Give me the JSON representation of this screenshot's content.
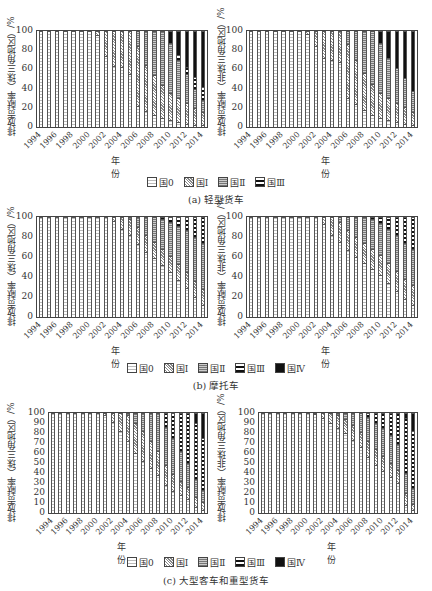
{
  "chart_data": [
    {
      "type": "bar",
      "stacked": true,
      "panel": "a",
      "region": "珠三角地区",
      "title": "",
      "xlabel": "年份",
      "ylabel": "排放贡献率（珠三角地区）/%",
      "ylim": [
        0,
        100
      ],
      "yticks": [
        0,
        20,
        40,
        60,
        80,
        100
      ],
      "categories": [
        "1994",
        "1995",
        "1996",
        "1997",
        "1998",
        "1999",
        "2000",
        "2001",
        "2002",
        "2003",
        "2004",
        "2005",
        "2006",
        "2007",
        "2008",
        "2009",
        "2010",
        "2011",
        "2012",
        "2013",
        "2014"
      ],
      "series": [
        {
          "name": "国0",
          "values": [
            100,
            100,
            100,
            100,
            100,
            100,
            100,
            96,
            74,
            64,
            62,
            55,
            22,
            17,
            12,
            9,
            7,
            5,
            3,
            2,
            2
          ]
        },
        {
          "name": "国I",
          "values": [
            0,
            0,
            0,
            0,
            0,
            0,
            0,
            4,
            26,
            36,
            38,
            45,
            62,
            48,
            42,
            35,
            28,
            25,
            22,
            18,
            14
          ]
        },
        {
          "name": "国II",
          "values": [
            0,
            0,
            0,
            0,
            0,
            0,
            0,
            0,
            0,
            0,
            0,
            0,
            16,
            35,
            46,
            56,
            53,
            40,
            30,
            20,
            12
          ]
        },
        {
          "name": "国III",
          "values": [
            0,
            0,
            0,
            0,
            0,
            0,
            0,
            0,
            0,
            0,
            0,
            0,
            0,
            0,
            0,
            0,
            0,
            5,
            8,
            12,
            14
          ]
        },
        {
          "name": "国IV",
          "values": [
            0,
            0,
            0,
            0,
            0,
            0,
            0,
            0,
            0,
            0,
            0,
            0,
            0,
            0,
            0,
            0,
            12,
            25,
            37,
            48,
            58
          ]
        }
      ]
    },
    {
      "type": "bar",
      "stacked": true,
      "panel": "a",
      "region": "非珠三角地区",
      "xlabel": "年份",
      "ylabel": "排放贡献率（非珠三角地区）/%",
      "ylim": [
        0,
        100
      ],
      "yticks": [
        0,
        20,
        40,
        60,
        80,
        100
      ],
      "categories": [
        "1994",
        "1995",
        "1996",
        "1997",
        "1998",
        "1999",
        "2000",
        "2001",
        "2002",
        "2003",
        "2004",
        "2005",
        "2006",
        "2007",
        "2008",
        "2009",
        "2010",
        "2011",
        "2012",
        "2013",
        "2014"
      ],
      "series": [
        {
          "name": "国0",
          "values": [
            100,
            100,
            100,
            100,
            100,
            100,
            100,
            97,
            84,
            72,
            70,
            68,
            30,
            24,
            18,
            12,
            9,
            7,
            5,
            3,
            2
          ]
        },
        {
          "name": "国I",
          "values": [
            0,
            0,
            0,
            0,
            0,
            0,
            0,
            3,
            16,
            28,
            30,
            32,
            56,
            46,
            38,
            33,
            26,
            23,
            20,
            18,
            14
          ]
        },
        {
          "name": "国II",
          "values": [
            0,
            0,
            0,
            0,
            0,
            0,
            0,
            0,
            0,
            0,
            0,
            0,
            14,
            30,
            44,
            55,
            53,
            42,
            36,
            30,
            22
          ]
        },
        {
          "name": "国III",
          "values": [
            0,
            0,
            0,
            0,
            0,
            0,
            0,
            0,
            0,
            0,
            0,
            0,
            0,
            0,
            0,
            0,
            0,
            0,
            0,
            0,
            0
          ]
        },
        {
          "name": "国IV",
          "values": [
            0,
            0,
            0,
            0,
            0,
            0,
            0,
            0,
            0,
            0,
            0,
            0,
            0,
            0,
            0,
            0,
            12,
            28,
            39,
            49,
            62
          ]
        }
      ]
    },
    {
      "type": "bar",
      "stacked": true,
      "panel": "b",
      "region": "珠三角地区",
      "xlabel": "年份",
      "ylabel": "排放贡献率（珠三角地区）/%",
      "ylim": [
        0,
        100
      ],
      "yticks": [
        0,
        20,
        40,
        60,
        80,
        100
      ],
      "categories": [
        "1994",
        "1995",
        "1996",
        "1997",
        "1998",
        "1999",
        "2000",
        "2001",
        "2002",
        "2003",
        "2004",
        "2005",
        "2006",
        "2007",
        "2008",
        "2009",
        "2010",
        "2011",
        "2012",
        "2013",
        "2014"
      ],
      "series": [
        {
          "name": "国0",
          "values": [
            100,
            100,
            100,
            100,
            100,
            100,
            100,
            100,
            100,
            96,
            88,
            82,
            73,
            65,
            59,
            52,
            45,
            37,
            29,
            20,
            12
          ]
        },
        {
          "name": "国I",
          "values": [
            0,
            0,
            0,
            0,
            0,
            0,
            0,
            0,
            0,
            4,
            12,
            16,
            17,
            17,
            16,
            16,
            16,
            16,
            16,
            16,
            16
          ]
        },
        {
          "name": "国II",
          "values": [
            0,
            0,
            0,
            0,
            0,
            0,
            0,
            0,
            0,
            0,
            0,
            2,
            10,
            18,
            25,
            30,
            34,
            38,
            42,
            44,
            46
          ]
        },
        {
          "name": "国III",
          "values": [
            0,
            0,
            0,
            0,
            0,
            0,
            0,
            0,
            0,
            0,
            0,
            0,
            0,
            0,
            0,
            2,
            5,
            9,
            13,
            20,
            26
          ]
        },
        {
          "name": "国IV",
          "values": [
            0,
            0,
            0,
            0,
            0,
            0,
            0,
            0,
            0,
            0,
            0,
            0,
            0,
            0,
            0,
            0,
            0,
            0,
            0,
            0,
            0
          ]
        }
      ]
    },
    {
      "type": "bar",
      "stacked": true,
      "panel": "b",
      "region": "非珠三角地区",
      "xlabel": "年份",
      "ylabel": "排放贡献率（非珠三角地区）/%",
      "ylim": [
        0,
        100
      ],
      "yticks": [
        0,
        20,
        40,
        60,
        80,
        100
      ],
      "categories": [
        "1994",
        "1995",
        "1996",
        "1997",
        "1998",
        "1999",
        "2000",
        "2001",
        "2002",
        "2003",
        "2004",
        "2005",
        "2006",
        "2007",
        "2008",
        "2009",
        "2010",
        "2011",
        "2012",
        "2013",
        "2014"
      ],
      "series": [
        {
          "name": "国0",
          "values": [
            100,
            100,
            100,
            100,
            100,
            100,
            100,
            100,
            100,
            93,
            82,
            75,
            67,
            60,
            54,
            48,
            42,
            34,
            26,
            18,
            12
          ]
        },
        {
          "name": "国I",
          "values": [
            0,
            0,
            0,
            0,
            0,
            0,
            0,
            0,
            0,
            7,
            18,
            20,
            20,
            20,
            20,
            20,
            20,
            20,
            20,
            20,
            20
          ]
        },
        {
          "name": "国II",
          "values": [
            0,
            0,
            0,
            0,
            0,
            0,
            0,
            0,
            0,
            0,
            0,
            5,
            13,
            20,
            26,
            30,
            32,
            34,
            36,
            36,
            36
          ]
        },
        {
          "name": "国III",
          "values": [
            0,
            0,
            0,
            0,
            0,
            0,
            0,
            0,
            0,
            0,
            0,
            0,
            0,
            0,
            0,
            2,
            6,
            12,
            18,
            26,
            32
          ]
        },
        {
          "name": "国IV",
          "values": [
            0,
            0,
            0,
            0,
            0,
            0,
            0,
            0,
            0,
            0,
            0,
            0,
            0,
            0,
            0,
            0,
            0,
            0,
            0,
            0,
            0
          ]
        }
      ]
    },
    {
      "type": "bar",
      "stacked": true,
      "panel": "c",
      "region": "珠三角地区",
      "xlabel": "年份",
      "ylabel": "排放贡献率（珠三角地区）/%",
      "ylim": [
        0,
        100
      ],
      "yticks": [
        0,
        10,
        20,
        30,
        40,
        50,
        60,
        70,
        80,
        90,
        100
      ],
      "categories": [
        "1994",
        "1995",
        "1996",
        "1997",
        "1998",
        "1999",
        "2000",
        "2001",
        "2002",
        "2003",
        "2004",
        "2005",
        "2006",
        "2007",
        "2008",
        "2009",
        "2010",
        "2011",
        "2012",
        "2013",
        "2014"
      ],
      "series": [
        {
          "name": "国0",
          "values": [
            100,
            100,
            100,
            100,
            100,
            100,
            100,
            98,
            91,
            82,
            72,
            60,
            52,
            45,
            38,
            28,
            22,
            18,
            14,
            6,
            3
          ]
        },
        {
          "name": "国I",
          "values": [
            0,
            0,
            0,
            0,
            0,
            0,
            0,
            2,
            9,
            18,
            26,
            30,
            30,
            27,
            24,
            20,
            17,
            14,
            12,
            10,
            8
          ]
        },
        {
          "name": "国II",
          "values": [
            0,
            0,
            0,
            0,
            0,
            0,
            0,
            0,
            0,
            0,
            2,
            10,
            18,
            28,
            38,
            38,
            36,
            30,
            24,
            18,
            12
          ]
        },
        {
          "name": "国III",
          "values": [
            0,
            0,
            0,
            0,
            0,
            0,
            0,
            0,
            0,
            0,
            0,
            0,
            0,
            0,
            0,
            14,
            25,
            38,
            50,
            56,
            52
          ]
        },
        {
          "name": "国IV",
          "values": [
            0,
            0,
            0,
            0,
            0,
            0,
            0,
            0,
            0,
            0,
            0,
            0,
            0,
            0,
            0,
            0,
            0,
            0,
            0,
            10,
            25
          ]
        }
      ]
    },
    {
      "type": "bar",
      "stacked": true,
      "panel": "c",
      "region": "非珠三角地区",
      "xlabel": "年份",
      "ylabel": "排放贡献率（非珠三角地区）/%",
      "ylim": [
        0,
        100
      ],
      "yticks": [
        0,
        10,
        20,
        30,
        40,
        50,
        60,
        70,
        80,
        90,
        100
      ],
      "categories": [
        "1994",
        "1995",
        "1996",
        "1997",
        "1998",
        "1999",
        "2000",
        "2001",
        "2002",
        "2003",
        "2004",
        "2005",
        "2006",
        "2007",
        "2008",
        "2009",
        "2010",
        "2011",
        "2012",
        "2013",
        "2014"
      ],
      "series": [
        {
          "name": "国0",
          "values": [
            100,
            100,
            100,
            100,
            100,
            100,
            100,
            99,
            95,
            90,
            85,
            80,
            73,
            66,
            56,
            48,
            42,
            36,
            30,
            8,
            3
          ]
        },
        {
          "name": "国I",
          "values": [
            0,
            0,
            0,
            0,
            0,
            0,
            0,
            1,
            5,
            10,
            13,
            14,
            15,
            15,
            16,
            16,
            15,
            14,
            13,
            12,
            6
          ]
        },
        {
          "name": "国II",
          "values": [
            0,
            0,
            0,
            0,
            0,
            0,
            0,
            0,
            0,
            0,
            2,
            6,
            12,
            19,
            24,
            26,
            28,
            28,
            26,
            20,
            16
          ]
        },
        {
          "name": "国III",
          "values": [
            0,
            0,
            0,
            0,
            0,
            0,
            0,
            0,
            0,
            0,
            0,
            0,
            0,
            0,
            4,
            10,
            15,
            22,
            31,
            55,
            57
          ]
        },
        {
          "name": "国IV",
          "values": [
            0,
            0,
            0,
            0,
            0,
            0,
            0,
            0,
            0,
            0,
            0,
            0,
            0,
            0,
            0,
            0,
            0,
            0,
            0,
            5,
            18
          ]
        }
      ]
    }
  ],
  "figure": {
    "panels": [
      {
        "id": "a",
        "caption": "(a) 轻型货车",
        "legend": [
          "国0",
          "国Ⅰ",
          "国Ⅱ",
          "国Ⅲ"
        ],
        "left_ylabel": "排放贡献率（珠三角地区）/%",
        "right_ylabel": "排放贡献率（非珠三角地区）/%"
      },
      {
        "id": "b",
        "caption": "(b) 摩托车",
        "legend": [
          "国0",
          "国Ⅰ",
          "国Ⅱ",
          "国Ⅲ",
          "国Ⅳ"
        ],
        "left_ylabel": "排放贡献率（珠三角地区）/%",
        "right_ylabel": "排放贡献率（非珠三角地区）/%"
      },
      {
        "id": "c",
        "caption": "(c) 大型客车和重型货车",
        "legend": [
          "国0",
          "国Ⅰ",
          "国Ⅱ",
          "国Ⅲ",
          "国Ⅳ"
        ],
        "left_ylabel": "排放贡献率（珠三角地区）/%",
        "right_ylabel": "排放贡献率（非珠三角地区）/%"
      }
    ],
    "xlabel": "年份",
    "xticks": [
      "1994",
      "1996",
      "1998",
      "2000",
      "2002",
      "2004",
      "2006",
      "2008",
      "2010",
      "2012",
      "2014"
    ]
  }
}
